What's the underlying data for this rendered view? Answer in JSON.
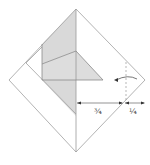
{
  "diagram": {
    "type": "origami-step",
    "colors": {
      "line": "#9a9a9a",
      "shade": "#d9d9d9",
      "arrow": "#555555"
    },
    "measure_left": {
      "label": "¾"
    },
    "measure_right": {
      "label": "¼"
    },
    "fold_arrow": {
      "icon": "fold-arrow-icon"
    }
  }
}
